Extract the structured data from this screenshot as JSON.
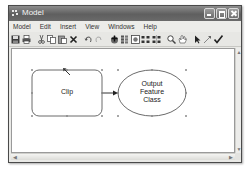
{
  "window": {
    "title": "Model",
    "controls": [
      "minimize",
      "maximize",
      "close"
    ]
  },
  "menubar": {
    "items": [
      {
        "label": "Model"
      },
      {
        "label": "Edit"
      },
      {
        "label": "Insert"
      },
      {
        "label": "View"
      },
      {
        "label": "Windows"
      },
      {
        "label": "Help"
      }
    ]
  },
  "toolbar": {
    "buttons": [
      {
        "icon": "save-icon"
      },
      {
        "icon": "print-icon"
      },
      {
        "icon": "cut-icon"
      },
      {
        "icon": "copy-icon"
      },
      {
        "icon": "paste-icon"
      },
      {
        "icon": "delete-icon"
      },
      {
        "icon": "undo-icon"
      },
      {
        "icon": "redo-icon"
      },
      {
        "icon": "add-data-icon"
      },
      {
        "icon": "model-properties-icon"
      },
      {
        "icon": "full-extent-icon"
      },
      {
        "icon": "auto-layout-icon"
      },
      {
        "icon": "select-all-icon"
      },
      {
        "icon": "zoom-in-icon"
      },
      {
        "icon": "pan-icon"
      },
      {
        "icon": "select-pointer-icon"
      },
      {
        "icon": "connect-icon"
      },
      {
        "icon": "validate-icon"
      }
    ]
  },
  "diagram": {
    "nodes": [
      {
        "id": "clip",
        "label": "Clip",
        "shape": "rounded-rectangle",
        "fill": "#ffffff",
        "stroke": "#555555"
      },
      {
        "id": "output",
        "label_lines": [
          "Output",
          "Feature",
          "Class"
        ],
        "shape": "ellipse",
        "fill": "#ffffff",
        "stroke": "#555555"
      }
    ],
    "connector": {
      "from": "clip",
      "to": "output"
    },
    "selected": true
  },
  "colors": {
    "titlebar": "#6a6a6a",
    "canvas": "#ffffff",
    "chrome": "#e9e9e6"
  }
}
